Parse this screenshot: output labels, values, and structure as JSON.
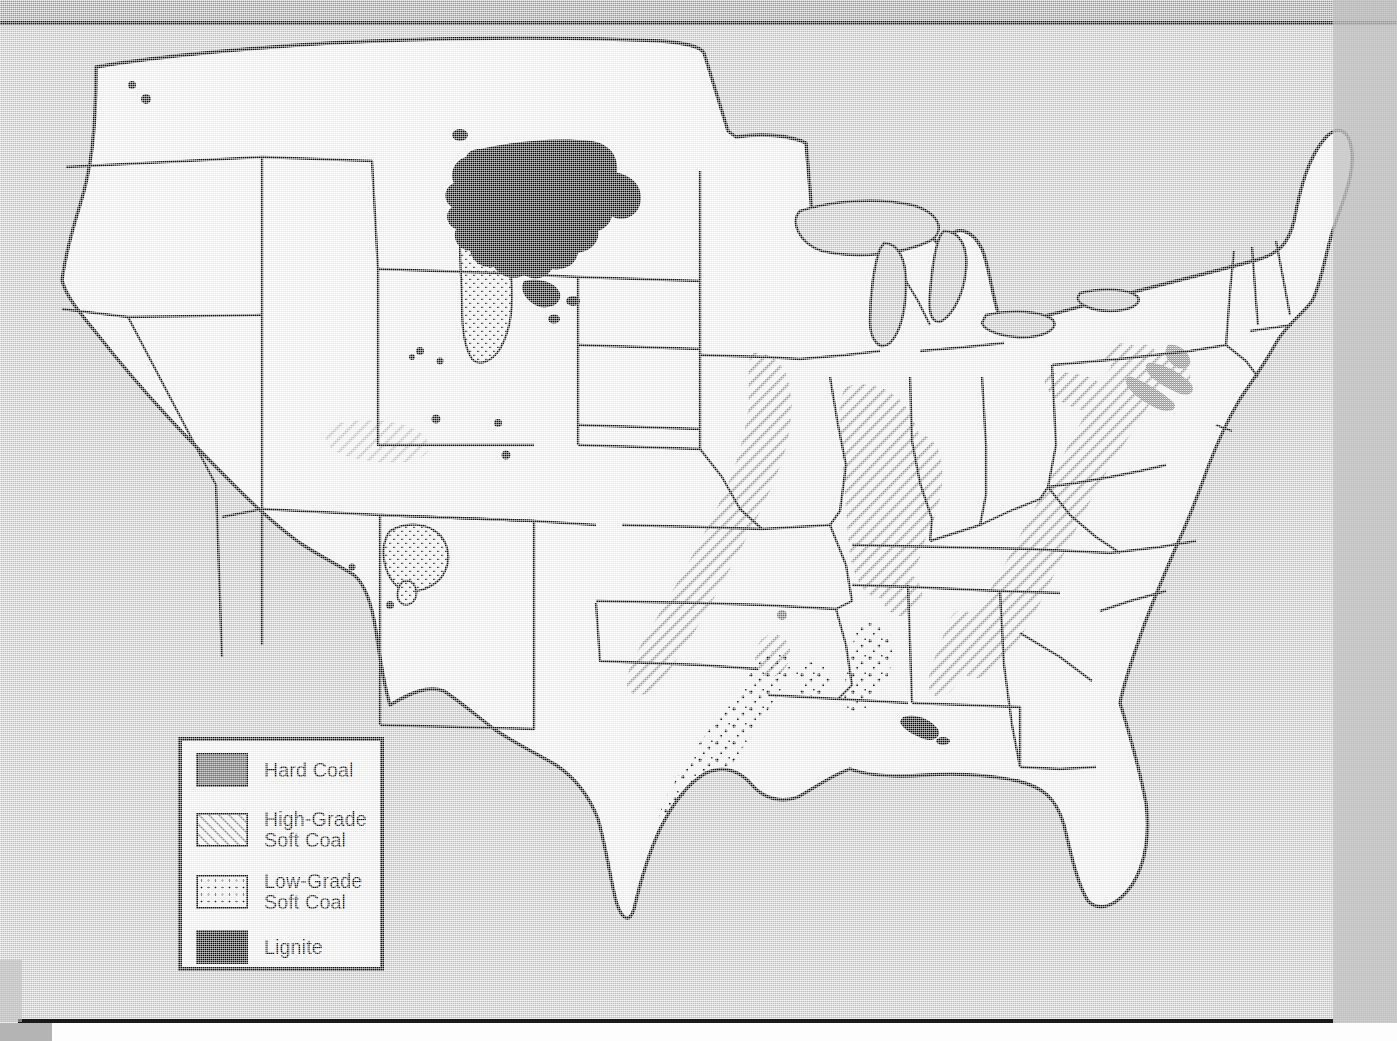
{
  "page": {
    "background_color": "#d2d2d2",
    "header_band_color": "#a8a8a8",
    "rule_color": "#1a1a1a"
  },
  "map": {
    "title": "Coal Deposits of the United States",
    "land_fill": "#ffffff",
    "water_fill": "#d2d2d2",
    "border_color": "#111111",
    "regions_described": [
      "Lignite across western North Dakota and eastern Montana",
      "Low-grade soft coal in the Powder River Basin of Wyoming",
      "Low-grade soft coal in the San Juan Basin of the Four Corners",
      "High-grade soft coal through the Appalachian belt from Pennsylvania to Alabama",
      "High-grade soft coal in the Illinois Basin",
      "Hard coal (anthracite) in northeastern Pennsylvania",
      "Scattered lignite along the Texas, Louisiana and Mississippi Gulf Coastal Plain"
    ]
  },
  "legend": {
    "name": "map-legend",
    "border_color": "#111111",
    "background_color": "#ffffff",
    "items": [
      {
        "label": "Hard Coal",
        "pattern": "solid-gray",
        "color": "#808080"
      },
      {
        "label": "High-Grade\nSoft Coal",
        "pattern": "diagonal-hatch",
        "color": "#9a9a9a"
      },
      {
        "label": "Low-Grade\nSoft Coal",
        "pattern": "stipple-dots",
        "color": "#111111"
      },
      {
        "label": "Lignite",
        "pattern": "solid-black",
        "color": "#0b0b0b"
      }
    ]
  }
}
